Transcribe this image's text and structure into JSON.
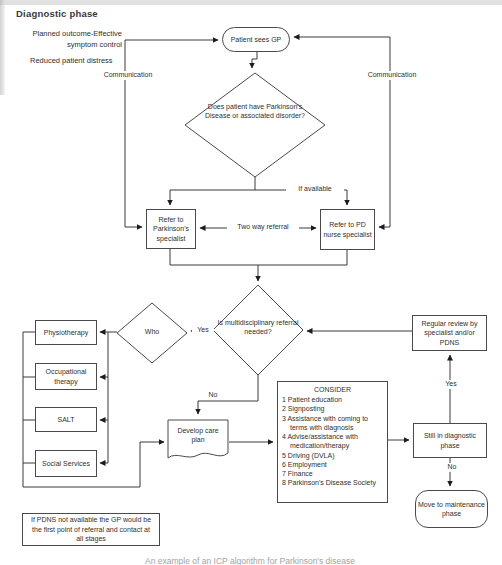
{
  "title": "Diagnostic phase",
  "annotations": {
    "planned_outcome_line1": "Planned outcome-Effective",
    "planned_outcome_line2": "symptom control",
    "reduced_distress": "Reduced patient distress",
    "communication_left": "Communication",
    "communication_right": "Communication"
  },
  "nodes": {
    "patient_sees_gp": "Patient sees GP",
    "pd_question": "Does patient have Parkinson's Disease or associated disorder?",
    "refer_specialist": "Refer to Parkinson's specialist",
    "refer_pd_nurse": "Refer to PD nurse specialist",
    "multidisciplinary_question": "Is multidisciplinary referral needed?",
    "who": "Who",
    "physiotherapy": "Physiotherapy",
    "occupational_therapy": "Occupational therapy",
    "salt": "SALT",
    "social_services": "Social Services",
    "develop_care_plan": "Develop care plan",
    "regular_review": "Regular review by specialist and/or PDNS",
    "still_in_diagnostic": "Still in diagnostic phase",
    "move_to_maintenance": "Move to maintenance phase"
  },
  "consider": {
    "title": "CONSIDER",
    "items": [
      "1 Patient education",
      "2 Signposting",
      "3 Assistance with coming to terms with diagnosis",
      "4 Advise/assistance with medication/therapy",
      "5 Driving (DVLA)",
      "6 Employment",
      "7 Finance",
      "8 Parkinson's Disease Society"
    ]
  },
  "edge_labels": {
    "if_available": "If available",
    "two_way_referral": "Two way referral",
    "yes_who": "Yes",
    "no_care_plan": "No",
    "yes_review": "Yes",
    "no_maintenance": "No"
  },
  "note": "If PDNS not available the GP would be the first point of referral and contact at all stages",
  "caption": "An example of an ICP algorithm for Parkinson's disease",
  "colors": {
    "line": "#3a3a3a",
    "text": "#2f2f2f",
    "background": "#ffffff"
  }
}
